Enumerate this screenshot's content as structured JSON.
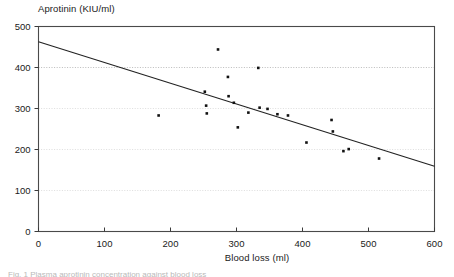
{
  "figure": {
    "caption": "Fig. 1 Plasma aprotinin concentration against blood loss"
  },
  "chart_data": {
    "type": "scatter",
    "title": "",
    "xlabel": "Blood loss (ml)",
    "ylabel": "Aprotinin (KIU/ml)",
    "xlim": [
      0,
      600
    ],
    "ylim": [
      0,
      500
    ],
    "xticks": [
      0,
      100,
      200,
      300,
      400,
      500,
      600
    ],
    "yticks": [
      0,
      100,
      200,
      300,
      400,
      500
    ],
    "grid": "horizontal-dotted",
    "legend": "none",
    "marker": "square",
    "marker_color": "#111111",
    "line_color": "#222222",
    "points": [
      {
        "x": 182,
        "y": 283
      },
      {
        "x": 252,
        "y": 341
      },
      {
        "x": 254,
        "y": 307
      },
      {
        "x": 255,
        "y": 288
      },
      {
        "x": 272,
        "y": 444
      },
      {
        "x": 287,
        "y": 377
      },
      {
        "x": 288,
        "y": 330
      },
      {
        "x": 296,
        "y": 314
      },
      {
        "x": 302,
        "y": 254
      },
      {
        "x": 318,
        "y": 290
      },
      {
        "x": 333,
        "y": 399
      },
      {
        "x": 335,
        "y": 302
      },
      {
        "x": 347,
        "y": 299
      },
      {
        "x": 362,
        "y": 286
      },
      {
        "x": 378,
        "y": 283
      },
      {
        "x": 406,
        "y": 217
      },
      {
        "x": 444,
        "y": 272
      },
      {
        "x": 446,
        "y": 244
      },
      {
        "x": 462,
        "y": 196
      },
      {
        "x": 470,
        "y": 201
      },
      {
        "x": 516,
        "y": 178
      }
    ],
    "fit_line": {
      "label": "linear regression",
      "x_start": 0,
      "y_start": 463,
      "x_end": 600,
      "y_end": 159
    }
  }
}
